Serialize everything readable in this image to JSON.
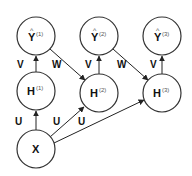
{
  "diagram": {
    "nodes": [
      {
        "id": "y1",
        "label": "Y",
        "hat": "^",
        "sup": "(1)",
        "cx": 36,
        "cy": 36
      },
      {
        "id": "y2",
        "label": "Y",
        "hat": "^",
        "sup": "(2)",
        "cx": 99,
        "cy": 36
      },
      {
        "id": "y3",
        "label": "Y",
        "hat": "^",
        "sup": "(3)",
        "cx": 162,
        "cy": 36
      },
      {
        "id": "h1",
        "label": "H",
        "sup": "(1)",
        "cx": 36,
        "cy": 91
      },
      {
        "id": "h2",
        "label": "H",
        "sup": "(2)",
        "cx": 99,
        "cy": 93
      },
      {
        "id": "h3",
        "label": "H",
        "sup": "(3)",
        "cx": 162,
        "cy": 93
      },
      {
        "id": "x",
        "label": "X",
        "sup": "",
        "cx": 36,
        "cy": 149
      }
    ],
    "edges": [
      {
        "from": "h1",
        "to": "y1",
        "label": "V"
      },
      {
        "from": "h2",
        "to": "y2",
        "label": "V"
      },
      {
        "from": "h3",
        "to": "y3",
        "label": "V"
      },
      {
        "from": "y1",
        "to": "h2",
        "label": "W"
      },
      {
        "from": "y2",
        "to": "h3",
        "label": "W"
      },
      {
        "from": "x",
        "to": "h1",
        "label": "U"
      },
      {
        "from": "x",
        "to": "h2",
        "label": "U"
      },
      {
        "from": "x",
        "to": "h3",
        "label": "U"
      }
    ],
    "edge_labels": {
      "v1": "V",
      "v2": "V",
      "v3": "V",
      "w1": "W",
      "w2": "W",
      "u1": "U",
      "u2": "U",
      "u3": "U"
    },
    "colors": {
      "stroke": "#333333",
      "text": "#111111",
      "background": "#ffffff"
    }
  }
}
